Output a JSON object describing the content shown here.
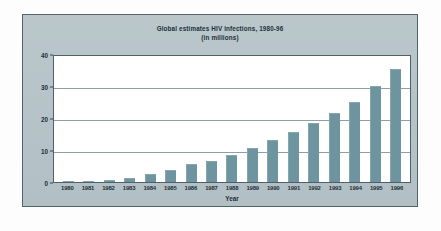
{
  "chart_data": {
    "type": "bar",
    "title": "Global estimates HIV infections, 1980-96",
    "subtitle": "(in millions)",
    "xlabel": "Year",
    "ylabel": "",
    "categories": [
      "1980",
      "1981",
      "1982",
      "1983",
      "1984",
      "1985",
      "1986",
      "1987",
      "1988",
      "1989",
      "1990",
      "1991",
      "1992",
      "1993",
      "1994",
      "1995",
      "1996"
    ],
    "values": [
      0.1,
      0.3,
      0.7,
      1.3,
      2.4,
      3.6,
      5.5,
      6.6,
      8.5,
      10.5,
      13.0,
      15.5,
      18.5,
      21.5,
      25.0,
      30.0,
      35.3
    ],
    "ylim": [
      0,
      40
    ],
    "yticks": [
      "0",
      "10",
      "20",
      "30",
      "40"
    ],
    "ytick_values": [
      0,
      10,
      20,
      30,
      40
    ],
    "grid": true,
    "legend": null,
    "bar_color": "#6e949f",
    "panel_color": "#b2c0c5",
    "plot_background": "#ffffff",
    "gridline_color": "#8f9fa6",
    "axis_color": "#4d6169",
    "text_color": "#1e2e38"
  }
}
